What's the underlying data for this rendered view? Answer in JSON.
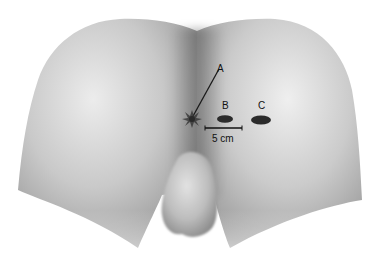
{
  "figure": {
    "markers": [
      {
        "id": "A",
        "label": "A"
      },
      {
        "id": "B",
        "label": "B"
      },
      {
        "id": "C",
        "label": "C"
      }
    ],
    "scale_bar": {
      "label": "5 cm"
    },
    "colors": {
      "background": "#ffffff",
      "skin_light": "#e6e6e6",
      "skin_mid": "#b8b8b8",
      "skin_dark": "#8a8a8a",
      "marker": "#2b2b2b",
      "line": "#1a1a1a"
    }
  }
}
